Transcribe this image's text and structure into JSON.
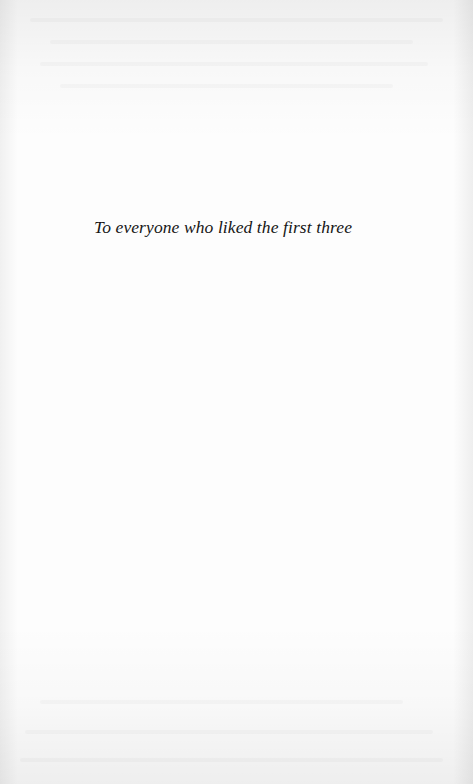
{
  "page": {
    "type": "dedication",
    "dedication_text": "To everyone who liked the first three"
  },
  "colors": {
    "paper": "#fdfdfd",
    "text": "#161616"
  }
}
